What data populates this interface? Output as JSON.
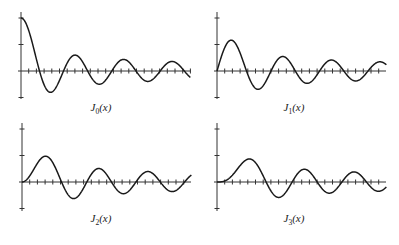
{
  "figure": {
    "line_color": "#1a1a1a",
    "axis_color": "#333333"
  },
  "chart_data": [
    {
      "type": "line",
      "title": "J_0(x)",
      "label_main": "J",
      "label_sub": "0",
      "label_arg": "(x)",
      "order": 0,
      "xlim": [
        0,
        22
      ],
      "ylim": [
        -0.5,
        1
      ],
      "yticks": [
        -0.5,
        0.5,
        1
      ],
      "xticks": [
        1,
        2,
        3,
        4,
        5,
        6,
        7,
        8,
        9,
        10,
        11,
        12,
        13,
        14,
        15,
        16,
        17,
        18,
        19,
        20,
        21,
        22
      ],
      "grid": false,
      "x": [
        0,
        1,
        2,
        3,
        4,
        5,
        6,
        7,
        8,
        9,
        10,
        11,
        12,
        13,
        14,
        15,
        16,
        17,
        18,
        19,
        20,
        21,
        22
      ],
      "values": [
        1.0,
        0.7652,
        0.2239,
        -0.2601,
        -0.3971,
        -0.1776,
        0.1506,
        0.3001,
        0.1717,
        -0.0903,
        -0.2459,
        -0.1712,
        0.0477,
        0.2069,
        0.1711,
        -0.0142,
        -0.1749,
        -0.1699,
        -0.0134,
        0.1466,
        0.167,
        0.0371,
        -0.1208
      ]
    },
    {
      "type": "line",
      "title": "J_1(x)",
      "label_main": "J",
      "label_sub": "1",
      "label_arg": "(x)",
      "order": 1,
      "xlim": [
        0,
        22
      ],
      "ylim": [
        -0.5,
        1
      ],
      "yticks": [
        -0.5,
        0.5,
        1
      ],
      "xticks": [
        1,
        2,
        3,
        4,
        5,
        6,
        7,
        8,
        9,
        10,
        11,
        12,
        13,
        14,
        15,
        16,
        17,
        18,
        19,
        20,
        21,
        22
      ],
      "grid": false,
      "x": [
        0,
        1,
        2,
        3,
        4,
        5,
        6,
        7,
        8,
        9,
        10,
        11,
        12,
        13,
        14,
        15,
        16,
        17,
        18,
        19,
        20,
        21,
        22
      ],
      "values": [
        0.0,
        0.4401,
        0.5767,
        0.3391,
        -0.066,
        -0.3276,
        -0.2767,
        -0.0047,
        0.2346,
        0.2453,
        0.0435,
        -0.1768,
        -0.2234,
        -0.0703,
        0.1334,
        0.2051,
        0.0904,
        -0.0977,
        -0.188,
        -0.1057,
        0.0668,
        0.1711,
        0.1172
      ]
    },
    {
      "type": "line",
      "title": "J_2(x)",
      "label_main": "J",
      "label_sub": "2",
      "label_arg": "(x)",
      "order": 2,
      "xlim": [
        0,
        22
      ],
      "ylim": [
        -0.5,
        1
      ],
      "yticks": [
        -0.5,
        0.5,
        1
      ],
      "xticks": [
        1,
        2,
        3,
        4,
        5,
        6,
        7,
        8,
        9,
        10,
        11,
        12,
        13,
        14,
        15,
        16,
        17,
        18,
        19,
        20,
        21,
        22
      ],
      "grid": false,
      "x": [
        0,
        1,
        2,
        3,
        4,
        5,
        6,
        7,
        8,
        9,
        10,
        11,
        12,
        13,
        14,
        15,
        16,
        17,
        18,
        19,
        20,
        21,
        22
      ],
      "values": [
        0.0,
        0.1149,
        0.3528,
        0.4861,
        0.3641,
        0.0466,
        -0.2429,
        -0.3014,
        -0.113,
        0.1448,
        0.2546,
        0.139,
        -0.0849,
        -0.2177,
        -0.152,
        0.0416,
        0.1862,
        0.1584,
        -0.0075,
        -0.1577,
        -0.1603,
        -0.0208,
        0.1274
      ]
    },
    {
      "type": "line",
      "title": "J_3(x)",
      "label_main": "J",
      "label_sub": "3",
      "label_arg": "(x)",
      "order": 3,
      "xlim": [
        0,
        22
      ],
      "ylim": [
        -0.5,
        1
      ],
      "yticks": [
        -0.5,
        0.5,
        1
      ],
      "xticks": [
        1,
        2,
        3,
        4,
        5,
        6,
        7,
        8,
        9,
        10,
        11,
        12,
        13,
        14,
        15,
        16,
        17,
        18,
        19,
        20,
        21,
        22
      ],
      "grid": false,
      "x": [
        0,
        1,
        2,
        3,
        4,
        5,
        6,
        7,
        8,
        9,
        10,
        11,
        12,
        13,
        14,
        15,
        16,
        17,
        18,
        19,
        20,
        21,
        22
      ],
      "values": [
        0.0,
        0.0196,
        0.1289,
        0.3091,
        0.4302,
        0.3648,
        0.1148,
        -0.1676,
        -0.2911,
        -0.1809,
        0.0584,
        0.2273,
        0.1951,
        0.0033,
        -0.1768,
        -0.194,
        -0.0438,
        0.1349,
        0.1863,
        0.0725,
        -0.0989,
        -0.175,
        -0.0875
      ]
    }
  ],
  "layout": {
    "panels": [
      {
        "ox": 21,
        "oy": 71,
        "x_end": 191,
        "y_top": 12,
        "y_bot": 99,
        "label_x": 101,
        "label_y": 101
      },
      {
        "ox": 217,
        "oy": 71,
        "x_end": 386,
        "y_top": 12,
        "y_bot": 99,
        "label_x": 294,
        "label_y": 101
      },
      {
        "ox": 22,
        "oy": 182,
        "x_end": 191,
        "y_top": 123,
        "y_bot": 211,
        "label_x": 101,
        "label_y": 212
      },
      {
        "ox": 217,
        "oy": 182,
        "x_end": 386,
        "y_top": 123,
        "y_bot": 211,
        "label_x": 294,
        "label_y": 212
      }
    ],
    "px_per_unit_x": 7.7,
    "px_per_unit_y": 53
  }
}
